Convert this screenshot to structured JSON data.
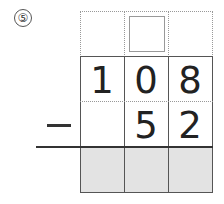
{
  "problem": {
    "number": "⑤",
    "operator": "−",
    "minuend": [
      "1",
      "0",
      "8"
    ],
    "subtrahend": [
      "",
      "5",
      "2"
    ],
    "answer": [
      "",
      "",
      ""
    ],
    "carry_box": ""
  },
  "colors": {
    "shade": "#e3e3e3",
    "line": "#555555",
    "dotted": "#999999"
  }
}
